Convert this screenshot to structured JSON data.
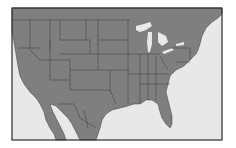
{
  "map": {
    "region": "United States, southern Canada and northern Mexico",
    "style": "grey political boundary map",
    "colors": {
      "land": "#7f7f7f",
      "water": "#e8e8e8",
      "border": "#3c3c3c",
      "frame": "#2a2a2a",
      "background": "#ffffff"
    },
    "frame": {
      "x": 12,
      "y": 8,
      "width": 210,
      "height": 132
    },
    "features": [
      "state-boundaries",
      "great-lakes",
      "gulf-of-mexico",
      "atlantic-ocean",
      "pacific-ocean",
      "gulf-of-california",
      "florida"
    ]
  }
}
